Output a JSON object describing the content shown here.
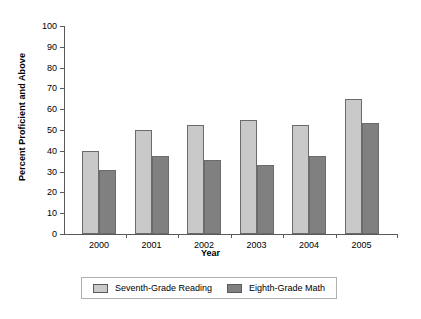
{
  "chart_data": {
    "type": "bar",
    "title": "",
    "xlabel": "Year",
    "ylabel": "Percent Proficient and Above",
    "categories": [
      "2000",
      "2001",
      "2002",
      "2003",
      "2004",
      "2005"
    ],
    "ylim": [
      0,
      100
    ],
    "yticks": [
      0,
      10,
      20,
      30,
      40,
      50,
      60,
      70,
      80,
      90,
      100
    ],
    "grid": false,
    "legend_position": "bottom",
    "series": [
      {
        "name": "Seventh-Grade Reading",
        "color": "#c9c9c9",
        "values": [
          40,
          50,
          52.5,
          55,
          52.5,
          65
        ]
      },
      {
        "name": "Eighth-Grade Math",
        "color": "#808080",
        "values": [
          31,
          37.5,
          35.5,
          33,
          37.5,
          53.5
        ]
      }
    ]
  },
  "axes": {
    "y_title": "Percent Proficient and Above",
    "x_title": "Year",
    "y_tick_labels": [
      "100",
      "90",
      "80",
      "70",
      "60",
      "50",
      "40",
      "30",
      "20",
      "10",
      "0"
    ],
    "x_tick_labels": [
      "2000",
      "2001",
      "2002",
      "2003",
      "2004",
      "2005"
    ]
  },
  "legend": {
    "entries": [
      {
        "label": "Seventh-Grade Reading",
        "color": "#c9c9c9"
      },
      {
        "label": "Eighth-Grade Math",
        "color": "#808080"
      }
    ]
  }
}
